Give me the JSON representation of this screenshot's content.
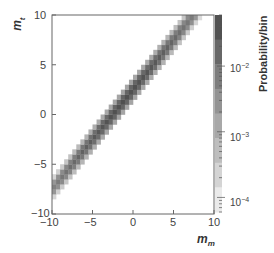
{
  "chart_data": {
    "type": "heatmap",
    "title": "",
    "xlabel": "m_m",
    "ylabel": "m_t",
    "xlim": [
      -10,
      10
    ],
    "ylim": [
      -10,
      10
    ],
    "x_ticks": [
      "-10",
      "-5",
      "0",
      "5",
      "10"
    ],
    "y_ticks": [
      "-10",
      "-5",
      "0",
      "5",
      "10"
    ],
    "grid": false,
    "colorbar": {
      "label": "Probability/bin",
      "scale": "log",
      "ticks": [
        "10^-4",
        "10^-3",
        "10^-2"
      ],
      "range": [
        6e-05,
        0.06
      ],
      "colormap": "grayscale (light = low, dark = high)"
    },
    "band": {
      "offset": 2.5,
      "peak_x": -1,
      "peak_value": 0.04,
      "width_bins": 2
    }
  },
  "labels": {
    "xlabel_main": "m",
    "xlabel_sub": "m",
    "ylabel_main": "m",
    "ylabel_sub": "t",
    "colorbar_title": "Probability/bin",
    "x_ticks": [
      "−10",
      "−5",
      "0",
      "5",
      "10"
    ],
    "y_ticks": [
      "10",
      "5",
      "0",
      "−5",
      "−10"
    ],
    "cb_ticks": [
      {
        "base": "10",
        "exp": "−2"
      },
      {
        "base": "10",
        "exp": "−3"
      },
      {
        "base": "10",
        "exp": "−4"
      }
    ]
  }
}
